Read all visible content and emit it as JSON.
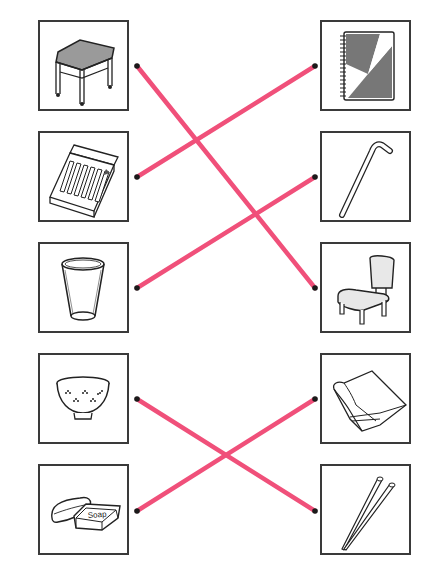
{
  "worksheet": {
    "left_items": [
      {
        "id": "stool",
        "label": "stool"
      },
      {
        "id": "crayons",
        "label": "box of crayons"
      },
      {
        "id": "cup",
        "label": "cup"
      },
      {
        "id": "rice-bowl",
        "label": "rice bowl"
      },
      {
        "id": "soap",
        "label": "soap",
        "printed_text": "Soap"
      }
    ],
    "right_items": [
      {
        "id": "notebook",
        "label": "notebook"
      },
      {
        "id": "hook-rod",
        "label": "hooked rod"
      },
      {
        "id": "chair",
        "label": "chair"
      },
      {
        "id": "towel",
        "label": "towel"
      },
      {
        "id": "chopsticks",
        "label": "chopsticks"
      }
    ],
    "matches": [
      {
        "left": 0,
        "right": 2
      },
      {
        "left": 1,
        "right": 0
      },
      {
        "left": 2,
        "right": 1
      },
      {
        "left": 3,
        "right": 4
      },
      {
        "left": 4,
        "right": 3
      }
    ],
    "colors": {
      "line": "#f0507a",
      "dot": "#1a1a1a",
      "border": "#3a3a3a"
    }
  }
}
